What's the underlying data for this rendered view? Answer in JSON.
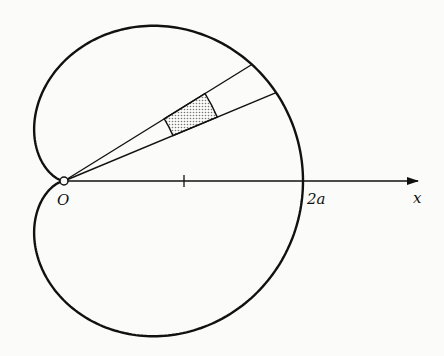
{
  "figure": {
    "curve": "cardioid",
    "equation_form": "r = a(1 + cos θ)",
    "labels": {
      "origin": "O",
      "intercept": "2a",
      "axis": "x"
    },
    "axis_tick_at": "a",
    "shaded_region": "polar area element between two rays",
    "colors": {
      "ink": "#111111",
      "background": "#fbfbf9",
      "shade": "#8a8a8a"
    }
  }
}
